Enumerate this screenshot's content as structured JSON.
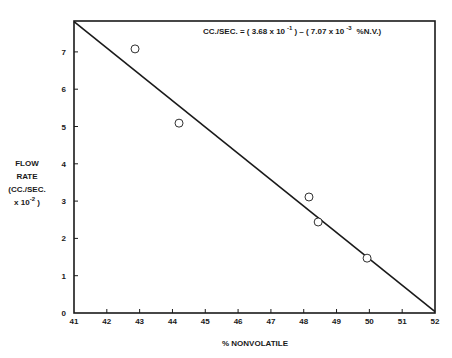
{
  "chart_data": {
    "type": "scatter",
    "title": "",
    "xlabel": "% NONVOLATILE",
    "ylabel_lines": [
      "FLOW",
      "RATE",
      "(CC./SEC.",
      "x 10^-2 )"
    ],
    "ylabel": "FLOW RATE (CC./SEC. x 10^-2 )",
    "xlim": [
      41,
      52
    ],
    "ylim": [
      0,
      7.8
    ],
    "x_ticks": [
      41,
      42,
      43,
      44,
      45,
      46,
      47,
      48,
      49,
      50,
      51,
      52
    ],
    "y_ticks": [
      0,
      1,
      2,
      3,
      4,
      5,
      6,
      7
    ],
    "grid": false,
    "legend": null,
    "series": [
      {
        "name": "Measured flow rate",
        "marker": "open-circle",
        "points": [
          {
            "x": 42.86,
            "y": 7.08
          },
          {
            "x": 44.2,
            "y": 5.09
          },
          {
            "x": 48.16,
            "y": 3.11
          },
          {
            "x": 48.44,
            "y": 2.44
          },
          {
            "x": 49.93,
            "y": 1.47
          }
        ]
      },
      {
        "name": "Regression line",
        "marker": "line",
        "points": [
          {
            "x": 41,
            "y": 7.81
          },
          {
            "x": 52,
            "y": 0.04
          }
        ]
      }
    ],
    "annotations": [
      {
        "text": "CC./SEC. = ( 3.68 x 10^-1 ) - ( 7.07 x 10^-3 %N.V.)",
        "position": "top-right inside plot",
        "parts": {
          "lhs": "CC./SEC. = ( 3.68 x 10",
          "exp1": "-1",
          "mid": ") – ( 7.07 x 10",
          "exp2": "-3",
          "rhs": "%N.V.)"
        }
      }
    ],
    "colors": {
      "ink": "#1a1a1a",
      "background": "#ffffff"
    }
  }
}
